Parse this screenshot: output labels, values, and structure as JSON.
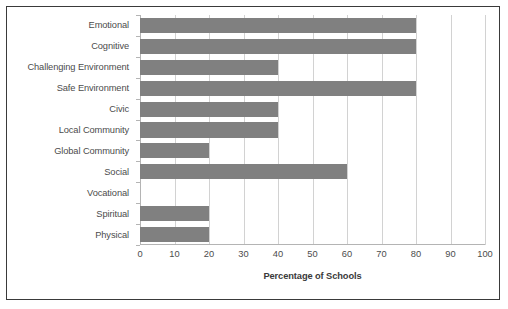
{
  "chart_data": {
    "type": "bar",
    "orientation": "horizontal",
    "title": "",
    "xlabel": "Percentage of Schools",
    "ylabel": "",
    "xlim": [
      0,
      100
    ],
    "xticks": [
      0,
      10,
      20,
      30,
      40,
      50,
      60,
      70,
      80,
      90,
      100
    ],
    "grid": true,
    "legend": false,
    "bar_color": "#808080",
    "gridline_color": "#d2d2d2",
    "axis_color": "#b4b4b4",
    "border_color": "#3a3a3a",
    "categories": [
      "Emotional",
      "Cognitive",
      "Challenging Environment",
      "Safe Environment",
      "Civic",
      "Local Community",
      "Global Community",
      "Social",
      "Vocational",
      "Spiritual",
      "Physical"
    ],
    "values": [
      80,
      80,
      40,
      80,
      40,
      40,
      20,
      60,
      0,
      20,
      20
    ]
  }
}
